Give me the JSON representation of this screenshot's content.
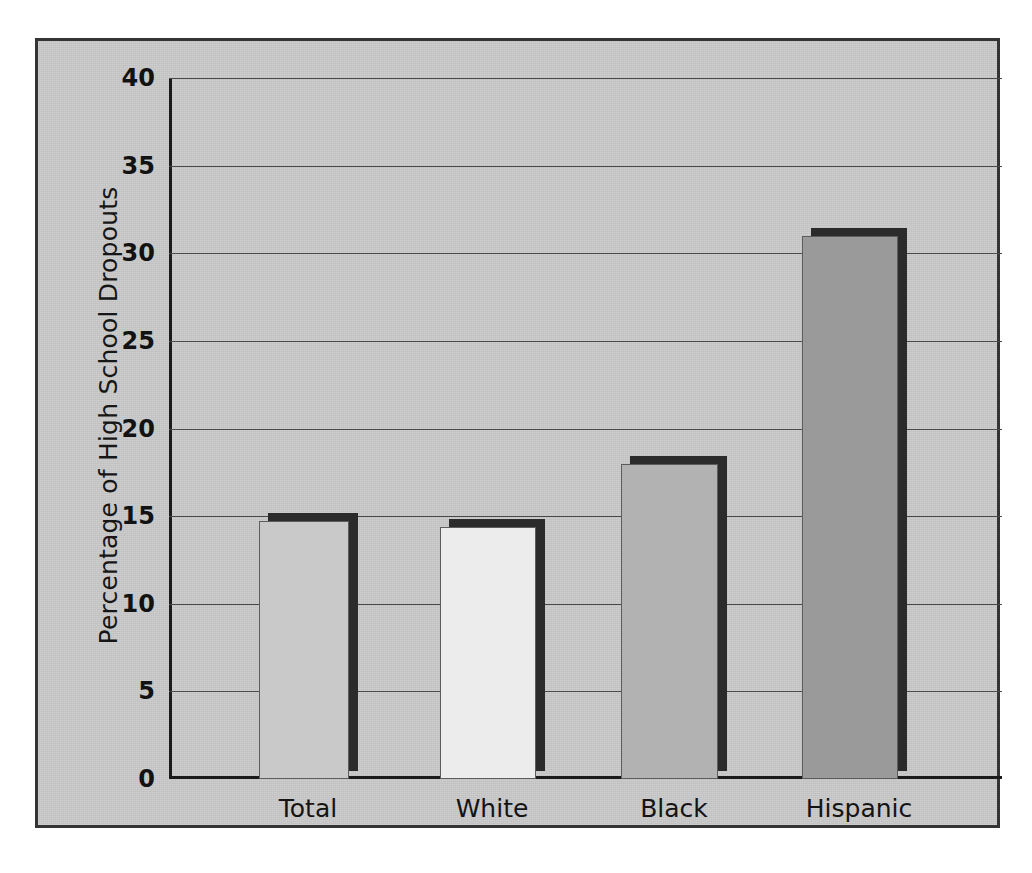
{
  "chart_data": {
    "type": "bar",
    "title": "",
    "subtitle": "",
    "xlabel": "",
    "ylabel": "Percentage of High School Dropouts",
    "categories": [
      "Total",
      "White",
      "Black",
      "Hispanic"
    ],
    "values": [
      14.7,
      14.4,
      18.0,
      31.0
    ],
    "series": [
      {
        "name": "Percentage of High School Dropouts",
        "values": [
          14.7,
          14.4,
          18.0,
          31.0
        ]
      }
    ],
    "ylim": [
      0,
      40
    ],
    "y_ticks": [
      "40",
      "35",
      "30",
      "25",
      "20",
      "15",
      "10",
      "5",
      "0"
    ],
    "y_tick_values": [
      40,
      35,
      30,
      25,
      20,
      15,
      10,
      5,
      0
    ],
    "grid": true,
    "grid_axis": "y",
    "legend": false,
    "legend_position": "none",
    "annotations": [],
    "bar_colors": [
      "#c9c9c9",
      "#ececec",
      "#b2b2b2",
      "#9a9a9a"
    ],
    "bar_shadow_color": "#2b2b2b",
    "panel_background": "#c6c6c6",
    "frame_color": "#343434",
    "axis_color": "#1b1b1b",
    "gridline_color": "#4a4a4a",
    "text_color": "#141414"
  }
}
